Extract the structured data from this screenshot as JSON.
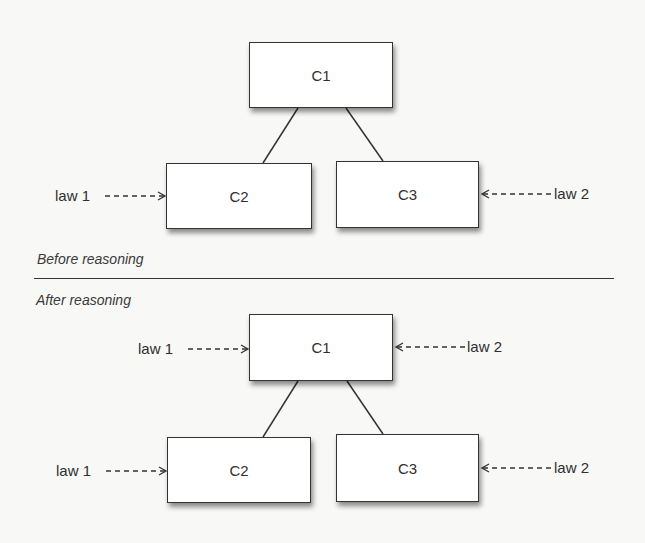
{
  "before": {
    "caption": "Before reasoning",
    "nodes": {
      "c1": "C1",
      "c2": "C2",
      "c3": "C3"
    },
    "laws": {
      "left": "law 1",
      "right": "law 2"
    }
  },
  "after": {
    "caption": "After reasoning",
    "nodes": {
      "c1": "C1",
      "c2": "C2",
      "c3": "C3"
    },
    "laws": {
      "c1_left": "law 1",
      "c1_right": "law 2",
      "c2_left": "law 1",
      "c3_right": "law 2"
    }
  },
  "colors": {
    "background": "#f8f8f6",
    "stroke": "#333333",
    "box_fill": "#ffffff"
  }
}
